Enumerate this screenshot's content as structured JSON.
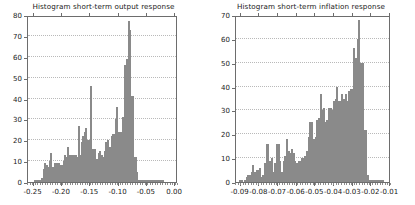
{
  "figure": {
    "background": "#ffffff",
    "bar_fill": "#c9c9c9",
    "bar_edge": "#8a8a8a",
    "axis_color": "#6d6d6d",
    "grid_color": "#b9b9b9"
  },
  "panels": [
    {
      "name": "output-response",
      "title": "Histogram short-term output response"
    },
    {
      "name": "inflation-response",
      "title": "Histogram short-term inflation response"
    }
  ],
  "chart_data": [
    {
      "type": "bar",
      "title": "Histogram short-term output response",
      "xlabel": "",
      "ylabel": "",
      "xlim": [
        -0.26,
        0.005
      ],
      "ylim": [
        0,
        80
      ],
      "grid": true,
      "legend": "none",
      "xticks": [
        -0.25,
        -0.2,
        -0.15,
        -0.1,
        -0.05,
        0.0
      ],
      "xtick_labels": [
        "-0.25",
        "-0.20",
        "-0.15",
        "-0.10",
        "-0.05",
        "0.00"
      ],
      "yticks": [
        0,
        10,
        20,
        30,
        40,
        50,
        60,
        70,
        80
      ],
      "ytick_labels": [
        "0",
        "10",
        "20",
        "30",
        "40",
        "50",
        "60",
        "70",
        "80"
      ],
      "bin_width": 0.0025,
      "x": [
        -0.2475,
        -0.245,
        -0.2425,
        -0.24,
        -0.2375,
        -0.235,
        -0.2325,
        -0.23,
        -0.2275,
        -0.225,
        -0.2225,
        -0.22,
        -0.2175,
        -0.215,
        -0.2125,
        -0.21,
        -0.2075,
        -0.205,
        -0.2025,
        -0.2,
        -0.1975,
        -0.195,
        -0.1925,
        -0.19,
        -0.1875,
        -0.185,
        -0.1825,
        -0.18,
        -0.1775,
        -0.175,
        -0.1725,
        -0.17,
        -0.1675,
        -0.165,
        -0.1625,
        -0.16,
        -0.1575,
        -0.155,
        -0.1525,
        -0.15,
        -0.1475,
        -0.145,
        -0.1425,
        -0.14,
        -0.1375,
        -0.135,
        -0.1325,
        -0.13,
        -0.1275,
        -0.125,
        -0.1225,
        -0.12,
        -0.1175,
        -0.115,
        -0.1125,
        -0.11,
        -0.1075,
        -0.105,
        -0.1025,
        -0.1,
        -0.0975,
        -0.095,
        -0.0925,
        -0.09,
        -0.0875,
        -0.085,
        -0.0825,
        -0.08,
        -0.0775,
        -0.075,
        -0.0725,
        -0.07,
        -0.0675,
        -0.065,
        -0.0625,
        -0.06,
        -0.0575,
        -0.055,
        -0.0525,
        -0.05,
        -0.0475,
        -0.045,
        -0.0425,
        -0.04,
        -0.0375,
        -0.035,
        -0.0325,
        -0.03,
        -0.0275,
        -0.025,
        -0.0225
      ],
      "values": [
        1,
        1,
        1,
        1,
        0,
        2,
        6,
        9,
        8,
        7,
        10,
        14,
        7,
        7,
        9,
        9,
        9,
        9,
        8,
        8,
        10,
        13,
        12,
        17,
        13,
        13,
        13,
        13,
        12,
        13,
        12,
        27,
        13,
        19,
        22,
        24,
        26,
        20,
        20,
        46,
        16,
        16,
        16,
        11,
        11,
        14,
        15,
        13,
        12,
        15,
        19,
        20,
        16,
        17,
        22,
        23,
        23,
        30,
        36,
        24,
        24,
        24,
        31,
        56,
        45,
        59,
        77,
        73,
        41,
        41,
        12,
        12,
        5,
        1,
        1,
        1,
        1,
        1,
        1,
        1,
        1,
        1,
        1,
        1,
        1,
        1,
        1,
        1,
        1,
        1,
        1
      ]
    },
    {
      "type": "bar",
      "title": "Histogram short-term inflation response",
      "xlabel": "",
      "ylabel": "",
      "xlim": [
        -0.0925,
        -0.0095
      ],
      "ylim": [
        0,
        70
      ],
      "grid": true,
      "legend": "none",
      "xticks": [
        -0.09,
        -0.08,
        -0.07,
        -0.06,
        -0.05,
        -0.04,
        -0.03,
        -0.02,
        -0.01
      ],
      "xtick_labels": [
        "-0.09",
        "-0.08",
        "-0.07",
        "-0.06",
        "-0.05",
        "-0.04",
        "-0.03",
        "-0.02",
        "-0.01"
      ],
      "yticks": [
        0,
        10,
        20,
        30,
        40,
        50,
        60,
        70
      ],
      "ytick_labels": [
        "0",
        "10",
        "20",
        "30",
        "40",
        "50",
        "60",
        "70"
      ],
      "bin_width": 0.0009,
      "x": [
        -0.0905,
        -0.0896,
        -0.0887,
        -0.0878,
        -0.0869,
        -0.086,
        -0.0851,
        -0.0842,
        -0.0833,
        -0.0824,
        -0.0815,
        -0.0806,
        -0.0797,
        -0.0788,
        -0.0779,
        -0.077,
        -0.0761,
        -0.0752,
        -0.0743,
        -0.0734,
        -0.0725,
        -0.0716,
        -0.0707,
        -0.0698,
        -0.0689,
        -0.068,
        -0.0671,
        -0.0662,
        -0.0653,
        -0.0644,
        -0.0635,
        -0.0626,
        -0.0617,
        -0.0608,
        -0.0599,
        -0.059,
        -0.0581,
        -0.0572,
        -0.0563,
        -0.0554,
        -0.0545,
        -0.0536,
        -0.0527,
        -0.0518,
        -0.0509,
        -0.05,
        -0.0491,
        -0.0482,
        -0.0473,
        -0.0464,
        -0.0455,
        -0.0446,
        -0.0437,
        -0.0428,
        -0.0419,
        -0.041,
        -0.0401,
        -0.0392,
        -0.0383,
        -0.0374,
        -0.0365,
        -0.0356,
        -0.0347,
        -0.0338,
        -0.0329,
        -0.032,
        -0.0311,
        -0.0302,
        -0.0293,
        -0.0284,
        -0.0275,
        -0.0266,
        -0.0257,
        -0.0248,
        -0.0239,
        -0.023,
        -0.0221,
        -0.0212,
        -0.0203,
        -0.0194,
        -0.0185,
        -0.0176,
        -0.0167,
        -0.0158,
        -0.0149,
        -0.014
      ],
      "values": [
        1,
        1,
        0,
        1,
        2,
        3,
        3,
        4,
        7,
        4,
        5,
        5,
        6,
        2,
        3,
        8,
        16,
        16,
        9,
        10,
        4,
        8,
        16,
        16,
        9,
        4,
        9,
        11,
        18,
        13,
        12,
        14,
        12,
        9,
        8,
        9,
        9,
        10,
        10,
        11,
        13,
        19,
        25,
        25,
        18,
        19,
        26,
        27,
        37,
        30,
        31,
        25,
        26,
        31,
        31,
        30,
        34,
        35,
        40,
        34,
        34,
        37,
        35,
        37,
        34,
        38,
        39,
        39,
        56,
        52,
        60,
        68,
        50,
        50,
        22,
        22,
        3,
        1,
        1,
        1,
        1,
        1,
        1,
        1,
        1,
        1
      ]
    }
  ]
}
